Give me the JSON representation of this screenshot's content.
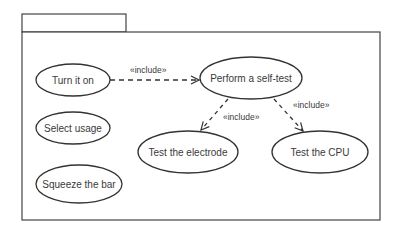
{
  "diagram": {
    "type": "uml-use-case",
    "package": {
      "name": ""
    },
    "use_cases": [
      {
        "id": "turn_on",
        "label": "Turn it on"
      },
      {
        "id": "select_usage",
        "label": "Select usage"
      },
      {
        "id": "squeeze_bar",
        "label": "Squeeze the bar"
      },
      {
        "id": "self_test",
        "label": "Perform a self-test"
      },
      {
        "id": "test_electrode",
        "label": "Test the electrode"
      },
      {
        "id": "test_cpu",
        "label": "Test the CPU"
      }
    ],
    "relations": [
      {
        "from": "turn_on",
        "to": "self_test",
        "label": "«include»"
      },
      {
        "from": "self_test",
        "to": "test_electrode",
        "label": "«include»"
      },
      {
        "from": "self_test",
        "to": "test_cpu",
        "label": "«include»"
      }
    ]
  }
}
